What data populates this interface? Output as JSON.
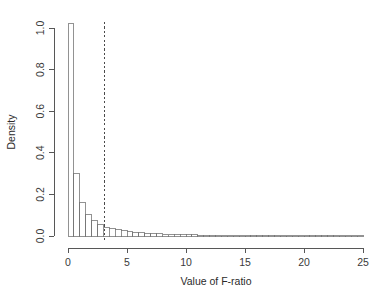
{
  "chart_data": {
    "type": "bar",
    "title": "",
    "subtitle": "",
    "xlabel": "Value of F-ratio",
    "ylabel": "Density",
    "xlim": [
      0,
      25
    ],
    "ylim": [
      0.0,
      1.04
    ],
    "grid": false,
    "legend": null,
    "bin_width": 0.5,
    "bar_fill": "#ffffff",
    "bar_stroke": "#6e6e6e",
    "x_ticks": [
      0,
      5,
      10,
      15,
      20,
      25
    ],
    "x_tick_labels": [
      "0",
      "5",
      "10",
      "15",
      "20",
      "25"
    ],
    "y_ticks": [
      0.0,
      0.2,
      0.4,
      0.6,
      0.8,
      1.0
    ],
    "y_tick_labels": [
      "0.0",
      "0.2",
      "0.4",
      "0.6",
      "0.8",
      "1.0"
    ],
    "bin_starts": [
      0.0,
      0.5,
      1.0,
      1.5,
      2.0,
      2.5,
      3.0,
      3.5,
      4.0,
      4.5,
      5.0,
      5.5,
      6.0,
      6.5,
      7.0,
      7.5,
      8.0,
      8.5,
      9.0,
      9.5,
      10.0,
      10.5,
      11.0,
      11.5,
      12.0,
      12.5,
      13.0,
      13.5,
      14.0,
      14.5,
      15.0,
      15.5,
      16.0,
      16.5,
      17.0,
      17.5,
      18.0,
      18.5,
      19.0,
      19.5,
      20.0,
      20.5,
      21.0,
      21.5,
      22.0,
      22.5,
      23.0,
      23.5,
      24.0,
      24.5
    ],
    "values": [
      1.02,
      0.3,
      0.16,
      0.105,
      0.075,
      0.055,
      0.043,
      0.036,
      0.03,
      0.025,
      0.021,
      0.018,
      0.016,
      0.014,
      0.012,
      0.01,
      0.009,
      0.008,
      0.007,
      0.006,
      0.005,
      0.005,
      0.004,
      0.004,
      0.003,
      0.003,
      0.003,
      0.002,
      0.002,
      0.002,
      0.002,
      0.002,
      0.001,
      0.001,
      0.001,
      0.001,
      0.001,
      0.001,
      0.001,
      0.001,
      0.001,
      0.001,
      0.001,
      0.001,
      0.001,
      0.001,
      0.001,
      0.001,
      0.001,
      0.001
    ],
    "annotations": [
      {
        "name": "critical-value-line",
        "type": "vline",
        "x": 3.1,
        "style": "dashed",
        "color": "#4a4a4a"
      }
    ]
  }
}
